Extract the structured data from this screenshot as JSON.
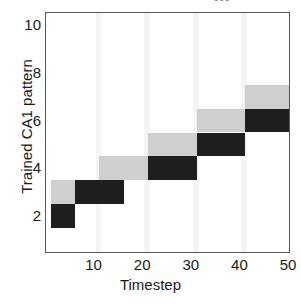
{
  "chart_data": {
    "type": "heatmap",
    "title": "",
    "xlabel": "Timestep",
    "ylabel": "Trained CA1 pattern",
    "xlim": [
      0,
      50
    ],
    "ylim": [
      0.5,
      10.5
    ],
    "xticks": [
      10,
      20,
      30,
      40,
      50
    ],
    "yticks": [
      2,
      4,
      6,
      8,
      10
    ],
    "grid": false,
    "legend": "none",
    "colors": {
      "dark": "#1e1e1e",
      "light": "#cfcfcf",
      "background": "#ffffff",
      "band": "#f4f4f4",
      "axis": "#555555",
      "text": "#1a1a1a"
    },
    "cells": [
      {
        "x0": 1,
        "x1": 6,
        "y0": 1.5,
        "y1": 2.5,
        "shade": "dark"
      },
      {
        "x0": 1,
        "x1": 6,
        "y0": 2.5,
        "y1": 3.5,
        "shade": "light"
      },
      {
        "x0": 6,
        "x1": 11,
        "y0": 2.5,
        "y1": 3.5,
        "shade": "dark"
      },
      {
        "x0": 11,
        "x1": 16,
        "y0": 2.5,
        "y1": 3.5,
        "shade": "dark"
      },
      {
        "x0": 11,
        "x1": 16,
        "y0": 3.5,
        "y1": 4.5,
        "shade": "light"
      },
      {
        "x0": 16,
        "x1": 21,
        "y0": 3.5,
        "y1": 4.5,
        "shade": "light"
      },
      {
        "x0": 21,
        "x1": 26,
        "y0": 3.5,
        "y1": 4.5,
        "shade": "dark"
      },
      {
        "x0": 26,
        "x1": 31,
        "y0": 3.5,
        "y1": 4.5,
        "shade": "dark"
      },
      {
        "x0": 21,
        "x1": 26,
        "y0": 4.5,
        "y1": 5.5,
        "shade": "light"
      },
      {
        "x0": 26,
        "x1": 31,
        "y0": 4.5,
        "y1": 5.5,
        "shade": "light"
      },
      {
        "x0": 31,
        "x1": 36,
        "y0": 4.5,
        "y1": 5.5,
        "shade": "dark"
      },
      {
        "x0": 36,
        "x1": 41,
        "y0": 4.5,
        "y1": 5.5,
        "shade": "dark"
      },
      {
        "x0": 31,
        "x1": 36,
        "y0": 5.5,
        "y1": 6.5,
        "shade": "light"
      },
      {
        "x0": 36,
        "x1": 41,
        "y0": 5.5,
        "y1": 6.5,
        "shade": "light"
      },
      {
        "x0": 41,
        "x1": 46,
        "y0": 5.5,
        "y1": 6.5,
        "shade": "dark"
      },
      {
        "x0": 46,
        "x1": 50,
        "y0": 5.5,
        "y1": 6.5,
        "shade": "dark"
      },
      {
        "x0": 41,
        "x1": 46,
        "y0": 6.5,
        "y1": 7.5,
        "shade": "light"
      },
      {
        "x0": 46,
        "x1": 50,
        "y0": 6.5,
        "y1": 7.5,
        "shade": "light"
      }
    ],
    "bands": [
      {
        "x0": 10.2,
        "x1": 11.4
      },
      {
        "x0": 20.2,
        "x1": 21.4
      },
      {
        "x0": 30.2,
        "x1": 31.4
      },
      {
        "x0": 40.2,
        "x1": 41.4
      }
    ]
  },
  "axes": {
    "xtick_labels": [
      "10",
      "20",
      "30",
      "40",
      "50"
    ],
    "ytick_labels": [
      "2",
      "4",
      "6",
      "8",
      "10"
    ],
    "xlabel": "Timestep",
    "ylabel": "Trained CA1 pattern"
  },
  "top_mark": "•••"
}
